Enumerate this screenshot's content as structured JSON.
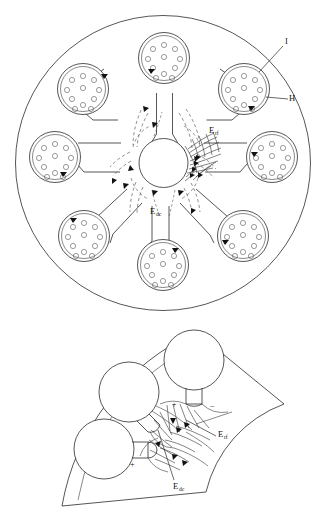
{
  "figure": {
    "background_color": "#ffffff",
    "line_color": "#2b2b2b",
    "panels": [
      {
        "id": "top-panel",
        "name": "full-disc-view",
        "description": "Full circular disc containing nine peripheral pod clusters connected by stems to a central hub, with dashed DC field lines and dense RF field lines",
        "pod_count": 9,
        "holes_per_pod": 11,
        "labels": [
          {
            "key": "I",
            "text": "I",
            "sub": "",
            "x": 287,
            "y": 44
          },
          {
            "key": "H",
            "text": "H",
            "sub": "",
            "x": 291,
            "y": 99
          },
          {
            "key": "Erf",
            "text": "E",
            "sub": "rf",
            "x": 211,
            "y": 133
          },
          {
            "key": "Edc",
            "text": "E",
            "sub": "dc",
            "x": 152,
            "y": 214
          }
        ]
      },
      {
        "id": "bottom-panel",
        "name": "magnified-sector-view",
        "description": "Magnified annular sector showing three pods, electrode polarity signs and field lines",
        "pod_count": 3,
        "labels": [
          {
            "key": "Erf",
            "text": "E",
            "sub": "rf",
            "x": 219,
            "y": 437
          },
          {
            "key": "Edc",
            "text": "E",
            "sub": "dc",
            "x": 175,
            "y": 487
          }
        ],
        "polarity_marks": [
          {
            "sign": "+",
            "x": 175,
            "y": 404
          },
          {
            "sign": "−",
            "x": 213,
            "y": 406
          },
          {
            "sign": "+",
            "x": 133,
            "y": 464
          }
        ]
      }
    ],
    "legend_terms": {
      "I": "I",
      "H": "H",
      "E_rf": "E rf",
      "E_dc": "E dc"
    }
  }
}
